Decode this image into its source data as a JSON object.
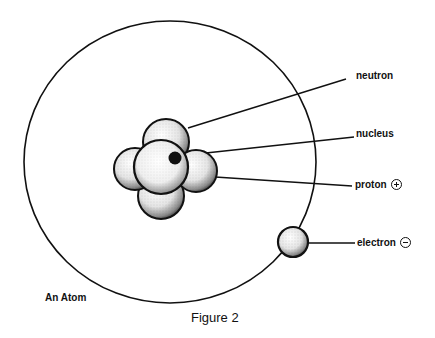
{
  "figure": {
    "caption": "Figure 2",
    "title_label": "An Atom"
  },
  "labels": {
    "neutron": "neutron",
    "nucleus": "nucleus",
    "proton": "proton",
    "electron": "electron"
  },
  "charges": {
    "proton": "positive",
    "electron": "negative"
  },
  "colors": {
    "ink": "#111111",
    "background": "#ffffff",
    "sphere_fill": "#f2f2f2",
    "nucleus_dot": "#111111"
  }
}
